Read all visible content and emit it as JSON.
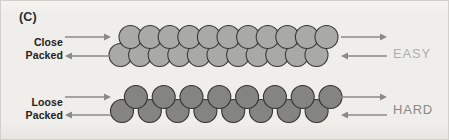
{
  "figure": {
    "panel_label": "(C)",
    "background_color": "#efeeea",
    "border_color": "#d2d0ca"
  },
  "labels": {
    "close_packed_line1": "Close",
    "close_packed_line2": "Packed",
    "loose_packed_line1": "Loose",
    "loose_packed_line2": "Packed",
    "easy": "EASY",
    "hard": "HARD"
  },
  "colors": {
    "close_packed_fill": "#a9a9a7",
    "close_packed_stroke": "#3a3a3a",
    "loose_packed_fill": "#848482",
    "loose_packed_stroke": "#333333",
    "arrow_color": "#8a8a88",
    "easy_text": "#b0aeaa",
    "hard_text": "#8b8986",
    "label_text": "#222222"
  },
  "chart_data": {
    "type": "diagram",
    "rows": [
      {
        "name": "close-packed",
        "label": "Close Packed",
        "result": "EASY",
        "fill": "#a9a9a7",
        "radius": 11.5,
        "sub_rows": [
          {
            "name": "close-top-row",
            "count": 11,
            "cy": 36,
            "cx_start": 129.5,
            "cx_step": 19.6
          },
          {
            "name": "close-bottom-row",
            "count": 11,
            "cy": 54,
            "cx_start": 119.5,
            "cx_step": 19.6
          }
        ]
      },
      {
        "name": "loose-packed",
        "label": "Loose Packed",
        "result": "HARD",
        "fill": "#848482",
        "radius": 11.5,
        "zigzag": {
          "count": 16,
          "cx_start": 121,
          "cx_step": 13.9,
          "cy_low": 110,
          "cy_high": 96
        }
      }
    ],
    "arrows": [
      {
        "name": "left-top-arrow",
        "direction": "right",
        "x1": 64,
        "y1": 36,
        "x2": 110,
        "y2": 36
      },
      {
        "name": "left-bottom-arrow",
        "direction": "left",
        "x1": 110,
        "y1": 55,
        "x2": 64,
        "y2": 55
      },
      {
        "name": "right-top-arrow",
        "direction": "right",
        "x1": 340,
        "y1": 36,
        "x2": 386,
        "y2": 36
      },
      {
        "name": "right-bottom-arrow",
        "direction": "left",
        "x1": 386,
        "y1": 55,
        "x2": 340,
        "y2": 55
      },
      {
        "name": "left-top-arrow-loose",
        "direction": "right",
        "x1": 64,
        "y1": 96,
        "x2": 110,
        "y2": 96
      },
      {
        "name": "left-bottom-arrow-loose",
        "direction": "left",
        "x1": 110,
        "y1": 114,
        "x2": 64,
        "y2": 114
      },
      {
        "name": "right-top-arrow-loose",
        "direction": "right",
        "x1": 340,
        "y1": 96,
        "x2": 386,
        "y2": 96
      },
      {
        "name": "right-bottom-arrow-loose",
        "direction": "left",
        "x1": 386,
        "y1": 114,
        "x2": 340,
        "y2": 114
      }
    ]
  }
}
